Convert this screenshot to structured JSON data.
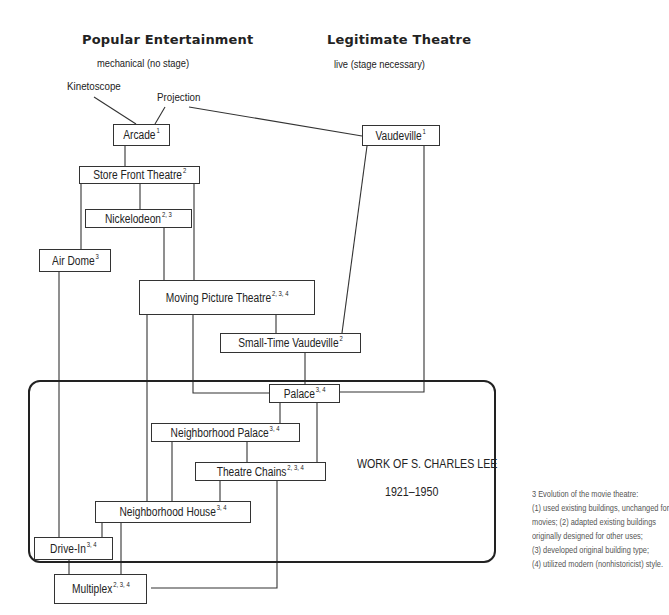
{
  "headers": {
    "popular": {
      "title": "Popular Entertainment",
      "subtitle": "mechanical (no stage)"
    },
    "legitimate": {
      "title": "Legitimate Theatre",
      "subtitle": "live (stage necessary)"
    }
  },
  "origins": {
    "kinetoscope": "Kinetoscope",
    "projection": "Projection"
  },
  "nodes": {
    "arcade": {
      "label": "Arcade",
      "sup": "1"
    },
    "vaudeville": {
      "label": "Vaudeville",
      "sup": "1"
    },
    "store_front": {
      "label": "Store Front Theatre",
      "sup": "2"
    },
    "nickelodeon": {
      "label": "Nickelodeon",
      "sup": "2, 3"
    },
    "air_dome": {
      "label": "Air Dome",
      "sup": "3"
    },
    "moving_picture": {
      "label": "Moving Picture Theatre",
      "sup": "2, 3, 4"
    },
    "small_time_vaudeville": {
      "label": "Small-Time Vaudeville",
      "sup": "2"
    },
    "palace": {
      "label": "Palace",
      "sup": "3, 4"
    },
    "neighborhood_palace": {
      "label": "Neighborhood Palace",
      "sup": "3, 4"
    },
    "theatre_chains": {
      "label": "Theatre Chains",
      "sup": "2, 3, 4"
    },
    "neighborhood_house": {
      "label": "Neighborhood House",
      "sup": "3, 4"
    },
    "drive_in": {
      "label": "Drive-In",
      "sup": "3, 4"
    },
    "multiplex": {
      "label": "Multiplex",
      "sup": "2, 3, 4"
    }
  },
  "lee_box": {
    "title": "WORK OF S. CHARLES LEE",
    "years": "1921–1950"
  },
  "footnote": {
    "lines": [
      "3  Evolution of the movie theatre:",
      "(1) used existing buildings, unchanged for",
      "movies; (2) adapted existing buildings",
      "originally designed for other uses;",
      "(3) developed original building type;",
      "(4) utilized modern (nonhistoricist) style."
    ]
  },
  "colors": {
    "line": "#333333",
    "text": "#222222",
    "note_text": "#555555"
  }
}
